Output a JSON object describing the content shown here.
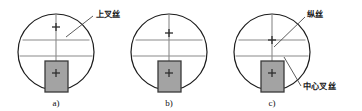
{
  "figure": {
    "title": "",
    "background_color": "#ffffff",
    "circle_outline_color": "#1c1c1c",
    "hair_line_color": "#8a8a8a",
    "vertical_hair_color": "#8a8a8a",
    "staff_fill_color": "#a3a3a3",
    "staff_border_color": "#3a3a3a",
    "leader_line_color": "#4a4a4a",
    "text_color": "#1a1a1a",
    "panels": [
      {
        "id": "panel-a",
        "caption": "a)",
        "circle": {
          "cx": 56,
          "cy": 52,
          "r": 38
        },
        "upper_hair_y": 40,
        "middle_hair_y": 56,
        "vertical_hair_x": 56,
        "cross_mark": {
          "x": 56,
          "y": 27,
          "size": 8
        },
        "staff": {
          "x": 45,
          "y": 61,
          "w": 23,
          "h": 31
        },
        "staff_cross": {
          "x": 56,
          "y": 73,
          "size": 8
        }
      },
      {
        "id": "panel-b",
        "caption": "b)",
        "circle": {
          "cx": 169,
          "cy": 52,
          "r": 38
        },
        "upper_hair_y": 40,
        "middle_hair_y": 56,
        "vertical_hair_x": 169,
        "cross_mark": {
          "x": 169,
          "y": 33,
          "size": 8
        },
        "staff": {
          "x": 158,
          "y": 61,
          "w": 23,
          "h": 31
        },
        "staff_cross": {
          "x": 169,
          "y": 73,
          "size": 8
        }
      },
      {
        "id": "panel-c",
        "caption": "c)",
        "circle": {
          "cx": 272,
          "cy": 52,
          "r": 38
        },
        "upper_hair_y": 40,
        "middle_hair_y": 56,
        "vertical_hair_x": 272,
        "cross_mark": {
          "x": 272,
          "y": 40,
          "size": 8
        },
        "staff": {
          "x": 261,
          "y": 61,
          "w": 23,
          "h": 31
        },
        "staff_cross": {
          "x": 272,
          "y": 73,
          "size": 8
        }
      }
    ],
    "annotations": [
      {
        "id": "annotation-upper-crosshair",
        "text": "上叉丝",
        "text_x": 96,
        "text_y": 17,
        "leader": {
          "x1": 93,
          "y1": 16,
          "x2": 66,
          "y2": 37
        }
      },
      {
        "id": "annotation-vertical-hair",
        "text": "纵丝",
        "text_x": 307,
        "text_y": 17,
        "leader": {
          "x1": 305,
          "y1": 17,
          "x2": 274,
          "y2": 47
        }
      },
      {
        "id": "annotation-center-crosshair",
        "text": "中心叉丝",
        "text_x": 303,
        "text_y": 89,
        "leader": {
          "x1": 301,
          "y1": 86,
          "x2": 284,
          "y2": 57
        }
      }
    ],
    "captions": [
      {
        "id": "caption-a",
        "text": "a)",
        "x": 56,
        "y": 106
      },
      {
        "id": "caption-b",
        "text": "b)",
        "x": 169,
        "y": 106
      },
      {
        "id": "caption-c",
        "text": "c)",
        "x": 272,
        "y": 106
      }
    ]
  }
}
